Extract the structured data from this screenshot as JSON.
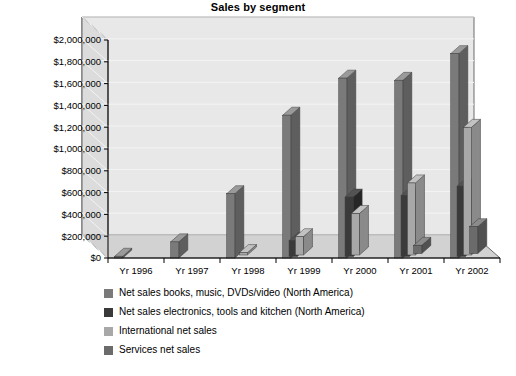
{
  "chart_data": {
    "type": "bar",
    "title": "Sales by segment",
    "xlabel": "",
    "ylabel": "",
    "ylim": [
      0,
      2000000
    ],
    "grid": true,
    "legend_position": "bottom-left",
    "projection": "3d",
    "categories": [
      "Yr 1996",
      "Yr 1997",
      "Yr 1998",
      "Yr 1999",
      "Yr 2000",
      "Yr 2001",
      "Yr 2002"
    ],
    "ytick_labels": [
      "$0",
      "$200,000",
      "$400,000",
      "$600,000",
      "$800,000",
      "$1,000,000",
      "$1,200,000",
      "$1,400,000",
      "$1,600,000",
      "$1,800,000",
      "$2,000,000"
    ],
    "ytick_values": [
      0,
      200000,
      400000,
      600000,
      800000,
      1000000,
      1200000,
      1400000,
      1600000,
      1800000,
      2000000
    ],
    "series": [
      {
        "name": "Net sales books, music, DVDs/video (North America)",
        "color": "#7a7a7a",
        "side_color": "#5e5e5e",
        "top_color": "#9a9a9a",
        "values": [
          16000,
          148000,
          590000,
          1310000,
          1650000,
          1630000,
          1875000
        ]
      },
      {
        "name": "Net sales electronics, tools and kitchen (North America)",
        "color": "#3a3a3a",
        "side_color": "#262626",
        "top_color": "#535353",
        "values": [
          0,
          0,
          0,
          145000,
          545000,
          560000,
          645000
        ]
      },
      {
        "name": "International net sales",
        "color": "#a8a8a8",
        "side_color": "#8a8a8a",
        "top_color": "#c2c2c2",
        "values": [
          0,
          0,
          22000,
          168000,
          381000,
          661000,
          1171000
        ]
      },
      {
        "name": "Services net sales",
        "color": "#6b6b6b",
        "side_color": "#515151",
        "top_color": "#8b8b8b",
        "values": [
          0,
          0,
          0,
          0,
          0,
          75000,
          246000
        ]
      }
    ]
  },
  "legend": {
    "items": [
      {
        "label": "Net sales books, music, DVDs/video (North America)",
        "color": "#7a7a7a"
      },
      {
        "label": "Net sales electronics, tools and kitchen (North America)",
        "color": "#3a3a3a"
      },
      {
        "label": "International net sales",
        "color": "#a8a8a8"
      },
      {
        "label": "Services net sales",
        "color": "#6b6b6b"
      }
    ]
  },
  "colors": {
    "plot_background": "#e8e8e8",
    "wall_shade": "#dcdcdc",
    "floor": "#d2d2d2",
    "gridline": "#f4f4f4",
    "axis": "#4a4a4a",
    "page_background": "#ffffff"
  }
}
